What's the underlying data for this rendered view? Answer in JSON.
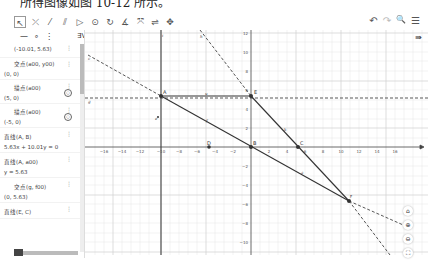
{
  "caption": "所得图像如图 10-12 所示。",
  "toolbar": {
    "tools": [
      {
        "name": "move-tool",
        "glyph": "↖"
      },
      {
        "name": "point-tool",
        "glyph": "⤫"
      },
      {
        "name": "line-tool",
        "glyph": "⁄"
      },
      {
        "name": "parallel-tool",
        "glyph": "⫽"
      },
      {
        "name": "polygon-tool",
        "glyph": "▷"
      },
      {
        "name": "circle-tool",
        "glyph": "⊙"
      },
      {
        "name": "circle-three-points-tool",
        "glyph": "↻"
      },
      {
        "name": "angle-tool",
        "glyph": "∡"
      },
      {
        "name": "reflect-tool",
        "glyph": "⤧"
      },
      {
        "name": "slider-tool",
        "glyph": "⇌"
      },
      {
        "name": "move-view-tool",
        "glyph": "✥"
      }
    ],
    "undo": "↶",
    "redo": "↷",
    "search": "🔍",
    "menu": "☰"
  },
  "algebra": {
    "header_icons": {
      "swatch": "■",
      "line_style": "—",
      "point_style": "∘",
      "more": "⋮",
      "sort": "∃V"
    },
    "entries": [
      {
        "label": "(-10.01, 5.63)"
      },
      {
        "label": "交点(a00, y00)",
        "value": "(0, 0)"
      },
      {
        "label": "描点(a00)",
        "value": "(5, 0)"
      },
      {
        "label": "描点(a00)",
        "value": "(-5, 0)"
      },
      {
        "label": "直线(A, B)",
        "value": "5.63x + 10.01y = 0"
      },
      {
        "label": "直线(A, a00)",
        "value": "y = 5.63"
      },
      {
        "label": "交点(g, f00)",
        "value": "(0, 5.63)"
      },
      {
        "label": "直线(E, C)"
      }
    ]
  },
  "graph": {
    "x_ticks": [
      "-16",
      "-14",
      "-12",
      "-10",
      "-8",
      "-6",
      "-4",
      "-2",
      "0",
      "2",
      "4",
      "6",
      "8",
      "10",
      "12",
      "14",
      "16"
    ],
    "y_ticks": [
      "12",
      "10",
      "8",
      "6",
      "4",
      "2",
      "-2",
      "-4",
      "-6",
      "-8",
      "-10"
    ],
    "points": {
      "A": "A",
      "B": "B",
      "C": "C",
      "D": "D",
      "E": "E",
      "F": "F"
    },
    "labels": {
      "h": "h",
      "f": "f",
      "g": "g",
      "i": "i",
      "e": "e",
      "c": "c",
      "k": "k",
      "a": "a",
      "b": "b",
      "j": "j"
    }
  },
  "sidebuttons": {
    "home": "⌂",
    "zoom_in": "⊕",
    "zoom_out": "⊖",
    "fullscreen": "⛶"
  },
  "style_bar_toggle": "⇛"
}
